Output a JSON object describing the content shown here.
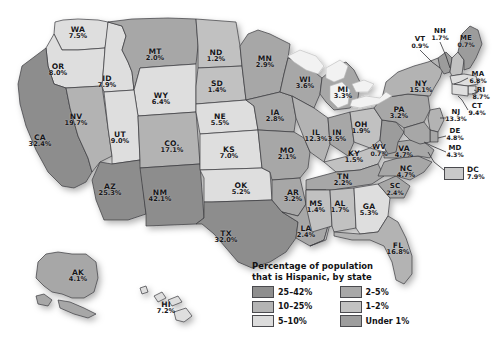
{
  "title": "Percentage of population that is Hispanic, by state",
  "legend": {
    "title_line1": "Percentage of population",
    "title_line2": "that is Hispanic, by state",
    "items": [
      {
        "label": "25–42%",
        "color": "#8e8e8e"
      },
      {
        "label": "2–5%",
        "color": "#a8a8a8"
      },
      {
        "label": "10–25%",
        "color": "#b4b4b4"
      },
      {
        "label": "1–2%",
        "color": "#c2c2c2"
      },
      {
        "label": "5–10%",
        "color": "#dcdcdc"
      },
      {
        "label": "Under 1%",
        "color": "#9d9d9d"
      }
    ]
  },
  "dc": {
    "abbr": "DC",
    "pct": "7.9%",
    "color": "#c9c9c9"
  },
  "colors": {
    "band_25_42": "#8d8d8d",
    "band_10_25": "#b3b3b3",
    "band_5_10": "#dedede",
    "band_2_5": "#a7a7a7",
    "band_1_2": "#c1c1c1",
    "band_under1": "#9c9c9c",
    "water": "#f2f2f2",
    "outline": "#3a3a3e",
    "background": "#ffffff"
  },
  "chart_data": {
    "type": "map",
    "title": "Percentage of population that is Hispanic, by state",
    "unit": "percent",
    "regions": [
      {
        "abbr": "WA",
        "pct": "7.5%",
        "value": 7.5,
        "band": "5–10%"
      },
      {
        "abbr": "OR",
        "pct": "8.0%",
        "value": 8.0,
        "band": "5–10%"
      },
      {
        "abbr": "CA",
        "pct": "32.4%",
        "value": 32.4,
        "band": "25–42%"
      },
      {
        "abbr": "NV",
        "pct": "19.7%",
        "value": 19.7,
        "band": "10–25%"
      },
      {
        "abbr": "ID",
        "pct": "7.9%",
        "value": 7.9,
        "band": "5–10%"
      },
      {
        "abbr": "MT",
        "pct": "2.0%",
        "value": 2.0,
        "band": "2–5%"
      },
      {
        "abbr": "WY",
        "pct": "6.4%",
        "value": 6.4,
        "band": "5–10%"
      },
      {
        "abbr": "UT",
        "pct": "9.0%",
        "value": 9.0,
        "band": "5–10%"
      },
      {
        "abbr": "AZ",
        "pct": "25.3%",
        "value": 25.3,
        "band": "25–42%"
      },
      {
        "abbr": "CO.",
        "pct": "17.1%",
        "value": 17.1,
        "band": "10–25%"
      },
      {
        "abbr": "NM",
        "pct": "42.1%",
        "value": 42.1,
        "band": "25–42%"
      },
      {
        "abbr": "ND",
        "pct": "1.2%",
        "value": 1.2,
        "band": "1–2%"
      },
      {
        "abbr": "SD",
        "pct": "1.4%",
        "value": 1.4,
        "band": "1–2%"
      },
      {
        "abbr": "NE",
        "pct": "5.5%",
        "value": 5.5,
        "band": "5–10%"
      },
      {
        "abbr": "KS",
        "pct": "7.0%",
        "value": 7.0,
        "band": "5–10%"
      },
      {
        "abbr": "OK",
        "pct": "5.2%",
        "value": 5.2,
        "band": "5–10%"
      },
      {
        "abbr": "TX",
        "pct": "32.0%",
        "value": 32.0,
        "band": "25–42%"
      },
      {
        "abbr": "MN",
        "pct": "2.9%",
        "value": 2.9,
        "band": "2–5%"
      },
      {
        "abbr": "IA",
        "pct": "2.8%",
        "value": 2.8,
        "band": "2–5%"
      },
      {
        "abbr": "MO",
        "pct": "2.1%",
        "value": 2.1,
        "band": "2–5%"
      },
      {
        "abbr": "AR",
        "pct": "3.2%",
        "value": 3.2,
        "band": "2–5%"
      },
      {
        "abbr": "LA",
        "pct": "2.4%",
        "value": 2.4,
        "band": "2–5%"
      },
      {
        "abbr": "WI",
        "pct": "3.6%",
        "value": 3.6,
        "band": "2–5%"
      },
      {
        "abbr": "IL",
        "pct": "12.3%",
        "value": 12.3,
        "band": "10–25%"
      },
      {
        "abbr": "MI",
        "pct": "3.3%",
        "value": 3.3,
        "band": "2–5%"
      },
      {
        "abbr": "IN",
        "pct": "3.5%",
        "value": 3.5,
        "band": "2–5%"
      },
      {
        "abbr": "OH",
        "pct": "1.9%",
        "value": 1.9,
        "band": "1–2%"
      },
      {
        "abbr": "KY",
        "pct": "1.5%",
        "value": 1.5,
        "band": "1–2%"
      },
      {
        "abbr": "TN",
        "pct": "2.2%",
        "value": 2.2,
        "band": "2–5%"
      },
      {
        "abbr": "MS",
        "pct": "1.4%",
        "value": 1.4,
        "band": "1–2%"
      },
      {
        "abbr": "AL",
        "pct": "1.7%",
        "value": 1.7,
        "band": "1–2%"
      },
      {
        "abbr": "GA",
        "pct": "5.3%",
        "value": 5.3,
        "band": "5–10%"
      },
      {
        "abbr": "FL",
        "pct": "16.8%",
        "value": 16.8,
        "band": "10–25%"
      },
      {
        "abbr": "SC",
        "pct": "2.4%",
        "value": 2.4,
        "band": "2–5%"
      },
      {
        "abbr": "NC",
        "pct": "4.7%",
        "value": 4.7,
        "band": "2–5%"
      },
      {
        "abbr": "VA",
        "pct": "4.7%",
        "value": 4.7,
        "band": "2–5%"
      },
      {
        "abbr": "WV",
        "pct": "0.7%",
        "value": 0.7,
        "band": "Under 1%"
      },
      {
        "abbr": "PA",
        "pct": "3.2%",
        "value": 3.2,
        "band": "2–5%"
      },
      {
        "abbr": "NY",
        "pct": "15.1%",
        "value": 15.1,
        "band": "10–25%"
      },
      {
        "abbr": "VT",
        "pct": "0.9%",
        "value": 0.9,
        "band": "Under 1%"
      },
      {
        "abbr": "NH",
        "pct": "1.7%",
        "value": 1.7,
        "band": "1–2%"
      },
      {
        "abbr": "ME",
        "pct": "0.7%",
        "value": 0.7,
        "band": "Under 1%"
      },
      {
        "abbr": "MA",
        "pct": "6.8%",
        "value": 6.8,
        "band": "5–10%"
      },
      {
        "abbr": "RI",
        "pct": "8.7%",
        "value": 8.7,
        "band": "5–10%"
      },
      {
        "abbr": "CT",
        "pct": "9.4%",
        "value": 9.4,
        "band": "5–10%"
      },
      {
        "abbr": "NJ",
        "pct": "13.3%",
        "value": 13.3,
        "band": "10–25%"
      },
      {
        "abbr": "DE",
        "pct": "4.8%",
        "value": 4.8,
        "band": "2–5%"
      },
      {
        "abbr": "MD",
        "pct": "4.3%",
        "value": 4.3,
        "band": "2–5%"
      },
      {
        "abbr": "DC",
        "pct": "7.9%",
        "value": 7.9,
        "band": "5–10%"
      },
      {
        "abbr": "AK",
        "pct": "4.1%",
        "value": 4.1,
        "band": "2–5%"
      },
      {
        "abbr": "HI",
        "pct": "7.2%",
        "value": 7.2,
        "band": "5–10%"
      }
    ]
  },
  "labels": [
    {
      "abbr": "WA",
      "pct": "7.5%",
      "x": 78,
      "y": 33,
      "fill": "#dedede"
    },
    {
      "abbr": "OR",
      "pct": "8.0%",
      "x": 58,
      "y": 70,
      "fill": "#dedede"
    },
    {
      "abbr": "CA",
      "pct": "32.4%",
      "x": 40,
      "y": 141,
      "fill": "#8d8d8d"
    },
    {
      "abbr": "NV",
      "pct": "19.7%",
      "x": 76,
      "y": 120,
      "fill": "#b3b3b3"
    },
    {
      "abbr": "ID",
      "pct": "7.9%",
      "x": 107,
      "y": 82,
      "fill": "#dedede"
    },
    {
      "abbr": "MT",
      "pct": "2.0%",
      "x": 155,
      "y": 55,
      "fill": "#a7a7a7"
    },
    {
      "abbr": "WY",
      "pct": "6.4%",
      "x": 161,
      "y": 99,
      "fill": "#dedede"
    },
    {
      "abbr": "UT",
      "pct": "9.0%",
      "x": 120,
      "y": 138,
      "fill": "#dedede"
    },
    {
      "abbr": "AZ",
      "pct": "25.3%",
      "x": 110,
      "y": 190,
      "fill": "#8d8d8d"
    },
    {
      "abbr": "CO.",
      "pct": "17.1%",
      "x": 172,
      "y": 147,
      "fill": "#b3b3b3"
    },
    {
      "abbr": "NM",
      "pct": "42.1%",
      "x": 160,
      "y": 196,
      "fill": "#8d8d8d"
    },
    {
      "abbr": "ND",
      "pct": "1.2%",
      "x": 216,
      "y": 56,
      "fill": "#c1c1c1"
    },
    {
      "abbr": "SD",
      "pct": "1.4%",
      "x": 217,
      "y": 87,
      "fill": "#c1c1c1"
    },
    {
      "abbr": "NE",
      "pct": "5.5%",
      "x": 220,
      "y": 120,
      "fill": "#dedede"
    },
    {
      "abbr": "KS",
      "pct": "7.0%",
      "x": 229,
      "y": 153,
      "fill": "#dedede"
    },
    {
      "abbr": "OK",
      "pct": "5.2%",
      "x": 241,
      "y": 189,
      "fill": "#dedede"
    },
    {
      "abbr": "TX",
      "pct": "32.0%",
      "x": 226,
      "y": 237,
      "fill": "#8d8d8d"
    },
    {
      "abbr": "MN",
      "pct": "2.9%",
      "x": 265,
      "y": 62,
      "fill": "#a7a7a7"
    },
    {
      "abbr": "IA",
      "pct": "2.8%",
      "x": 275,
      "y": 116,
      "fill": "#a7a7a7"
    },
    {
      "abbr": "MO",
      "pct": "2.1%",
      "x": 287,
      "y": 154,
      "fill": "#a7a7a7"
    },
    {
      "abbr": "AR",
      "pct": "3.2%",
      "x": 293,
      "y": 196,
      "fill": "#a7a7a7"
    },
    {
      "abbr": "LA",
      "pct": "2.4%",
      "x": 306,
      "y": 232,
      "fill": "#a7a7a7"
    },
    {
      "abbr": "WI",
      "pct": "3.6%",
      "x": 305,
      "y": 83,
      "fill": "#a7a7a7"
    },
    {
      "abbr": "IL",
      "pct": "12.3%",
      "x": 316,
      "y": 136,
      "fill": "#b3b3b3"
    },
    {
      "abbr": "MI",
      "pct": "3.3%",
      "x": 343,
      "y": 93,
      "fill": "#a7a7a7"
    },
    {
      "abbr": "IN",
      "pct": "3.5%",
      "x": 337,
      "y": 136,
      "fill": "#a7a7a7"
    },
    {
      "abbr": "OH",
      "pct": "1.9%",
      "x": 361,
      "y": 128,
      "fill": "#c1c1c1"
    },
    {
      "abbr": "KY",
      "pct": "1.5%",
      "x": 354,
      "y": 157,
      "fill": "#c1c1c1"
    },
    {
      "abbr": "TN",
      "pct": "2.2%",
      "x": 343,
      "y": 180,
      "fill": "#a7a7a7"
    },
    {
      "abbr": "MS",
      "pct": "1.4%",
      "x": 316,
      "y": 207,
      "fill": "#c1c1c1"
    },
    {
      "abbr": "AL",
      "pct": "1.7%",
      "x": 340,
      "y": 207,
      "fill": "#c1c1c1"
    },
    {
      "abbr": "GA",
      "pct": "5.3%",
      "x": 369,
      "y": 210,
      "fill": "#dedede"
    },
    {
      "abbr": "FL",
      "pct": "16.8%",
      "x": 398,
      "y": 249,
      "fill": "#b3b3b3"
    },
    {
      "abbr": "SC",
      "pct": "2.4%",
      "x": 395,
      "y": 190,
      "fill": "#a7a7a7"
    },
    {
      "abbr": "NC",
      "pct": "4.7%",
      "x": 406,
      "y": 172,
      "fill": "#a7a7a7"
    },
    {
      "abbr": "VA",
      "pct": "4.7%",
      "x": 404,
      "y": 152,
      "fill": "#a7a7a7"
    },
    {
      "abbr": "WV",
      "pct": "0.7%",
      "x": 379,
      "y": 151,
      "fill": "#9c9c9c"
    },
    {
      "abbr": "PA",
      "pct": "3.2%",
      "x": 399,
      "y": 113,
      "fill": "#a7a7a7"
    },
    {
      "abbr": "NY",
      "pct": "15.1%",
      "x": 421,
      "y": 87,
      "fill": "#b3b3b3"
    },
    {
      "abbr": "VT",
      "pct": "0.9%",
      "x": 420,
      "y": 43,
      "fill": "#9c9c9c"
    },
    {
      "abbr": "NH",
      "pct": "1.7%",
      "x": 440,
      "y": 35,
      "fill": "#c1c1c1"
    },
    {
      "abbr": "ME",
      "pct": "0.7%",
      "x": 466,
      "y": 42,
      "fill": "#9c9c9c"
    },
    {
      "abbr": "MA",
      "pct": "6.8%",
      "x": 478,
      "y": 78,
      "fill": "#dedede"
    },
    {
      "abbr": "RI",
      "pct": "8.7%",
      "x": 481,
      "y": 94,
      "fill": "#dedede"
    },
    {
      "abbr": "CT",
      "pct": "9.4%",
      "x": 477,
      "y": 110,
      "fill": "#dedede"
    },
    {
      "abbr": "NJ",
      "pct": "13.3%",
      "x": 456,
      "y": 116,
      "fill": "#b3b3b3"
    },
    {
      "abbr": "DE",
      "pct": "4.8%",
      "x": 455,
      "y": 135,
      "fill": "#a7a7a7"
    },
    {
      "abbr": "MD",
      "pct": "4.3%",
      "x": 455,
      "y": 152,
      "fill": "#a7a7a7"
    },
    {
      "abbr": "AK",
      "pct": "4.1%",
      "x": 78,
      "y": 276,
      "fill": "#a7a7a7"
    },
    {
      "abbr": "HI",
      "pct": "7.2%",
      "x": 166,
      "y": 308,
      "fill": "#dedede"
    }
  ]
}
